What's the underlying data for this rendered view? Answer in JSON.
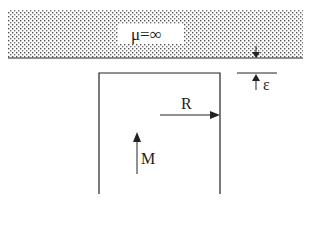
{
  "diagram": {
    "region": {
      "label": "μ=∞",
      "description": "infinitely permeable half-space"
    },
    "gap_label": "ε",
    "radius_label": "R",
    "magnetization_label": "M"
  },
  "colors": {
    "line": "#222222",
    "dots": "#555555",
    "background": "#ffffff"
  }
}
